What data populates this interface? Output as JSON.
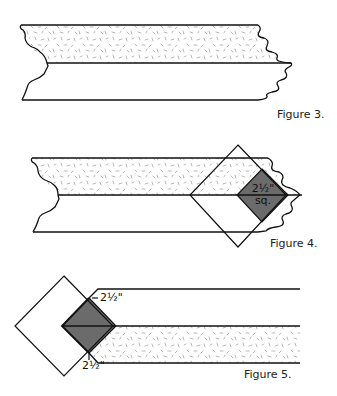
{
  "figures": [
    {
      "id": "figure-3",
      "caption": "Figure 3.",
      "description": "Two fabric strips sewn together along the long edge; top strip patterned, bottom strip plain"
    },
    {
      "id": "figure-4",
      "caption": "Figure 4.",
      "description": "Square placed on point over the strip end with a shaded square marked",
      "square_label_line1": "2½\"",
      "square_label_line2": "sq."
    },
    {
      "id": "figure-5",
      "caption": "Figure 5.",
      "description": "Strip set with corner square on point; shaded square measured",
      "dim_top": "2½\"",
      "dim_bottom": "2½\""
    }
  ],
  "colors": {
    "line": "#111111",
    "shaded_square": "#6b6b6b",
    "speckle": "#9a9a9a",
    "background": "#ffffff"
  }
}
